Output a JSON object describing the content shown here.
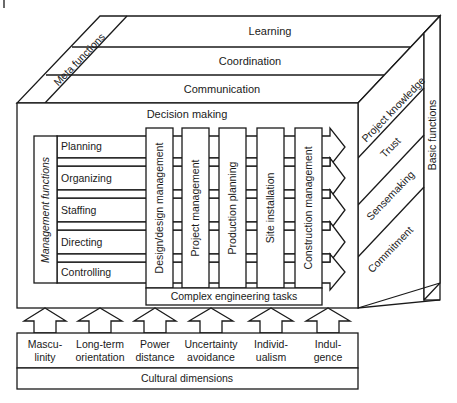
{
  "diagram": {
    "top_face": {
      "layers": [
        {
          "label": "Learning"
        },
        {
          "label": "Coordination"
        },
        {
          "label": "Communication"
        }
      ],
      "meta_label": "Meta functions"
    },
    "right_face": {
      "layers": [
        {
          "label": "Project knowledge"
        },
        {
          "label": "Trust"
        },
        {
          "label": "Sensemaking"
        },
        {
          "label": "Commitment"
        }
      ],
      "basic_label": "Basic functions"
    },
    "front_face": {
      "title": "Decision making",
      "management_label": "Management functions",
      "management_rows": [
        {
          "label": "Planning"
        },
        {
          "label": "Organizing"
        },
        {
          "label": "Staffing"
        },
        {
          "label": "Directing"
        },
        {
          "label": "Controlling"
        }
      ],
      "process_columns": [
        {
          "label": "Design/design management"
        },
        {
          "label": "Project management"
        },
        {
          "label": "Production planning"
        },
        {
          "label": "Site installation"
        },
        {
          "label": "Construction management"
        }
      ],
      "base_label": "Complex engineering tasks"
    },
    "cultural": {
      "dimensions": [
        {
          "line1": "Mascu-",
          "line2": "linity"
        },
        {
          "line1": "Long-term",
          "line2": "orientation"
        },
        {
          "line1": "Power",
          "line2": "distance"
        },
        {
          "line1": "Uncertainty",
          "line2": "avoidance"
        },
        {
          "line1": "Individ-",
          "line2": "ualism"
        },
        {
          "line1": "Indul-",
          "line2": "gence"
        }
      ],
      "title": "Cultural dimensions"
    },
    "colors": {
      "stroke": "#1a1a1a",
      "fill": "#ffffff"
    }
  }
}
